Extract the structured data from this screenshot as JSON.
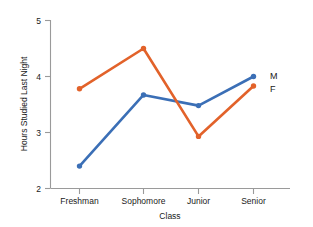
{
  "chart_data": {
    "type": "line",
    "title": "",
    "xlabel": "Class",
    "ylabel": "Hours Studied Last Night",
    "categories": [
      "Freshman",
      "Sophomore",
      "Junior",
      "Senior"
    ],
    "series": [
      {
        "name": "M",
        "color": "#3b6fb6",
        "values": [
          2.4,
          3.67,
          3.48,
          4.0
        ]
      },
      {
        "name": "F",
        "color": "#e2622a",
        "values": [
          3.78,
          4.5,
          2.93,
          3.83
        ]
      }
    ],
    "ylim": [
      2,
      5
    ],
    "yticks": [
      2,
      3,
      4,
      5
    ],
    "ytick_labels": [
      "2",
      "3",
      "4",
      "5"
    ],
    "grid": false,
    "legend_position": "right-inline"
  },
  "axis": {
    "y_title": "Hours Studied Last Night",
    "x_title": "Class"
  },
  "legend": {
    "male_label": "M",
    "female_label": "F"
  }
}
